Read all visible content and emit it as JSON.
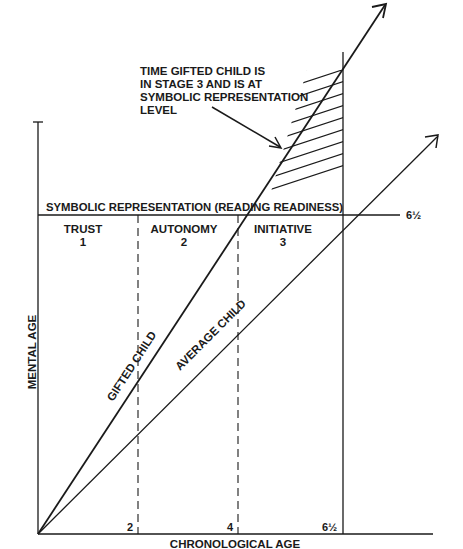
{
  "diagram": {
    "annotation": {
      "lines": [
        "TIME GIFTED CHILD IS",
        "IN STAGE 3 AND IS AT",
        "SYMBOLIC REPRESENTATION",
        "LEVEL"
      ]
    },
    "threshold_label": "SYMBOLIC REPRESENTATION (READING READINESS)",
    "threshold_value": "6½",
    "stages": [
      {
        "name": "TRUST",
        "number": "1"
      },
      {
        "name": "AUTONOMY",
        "number": "2"
      },
      {
        "name": "INITIATIVE",
        "number": "3"
      }
    ],
    "lines": [
      {
        "label": "GIFTED CHILD"
      },
      {
        "label": "AVERAGE CHILD"
      }
    ],
    "x_ticks": [
      "2",
      "4",
      "6½"
    ],
    "x_axis_label": "CHRONOLOGICAL AGE",
    "y_axis_label": "MENTAL AGE",
    "colors": {
      "ink": "#1a1a1a",
      "background": "#ffffff"
    }
  }
}
